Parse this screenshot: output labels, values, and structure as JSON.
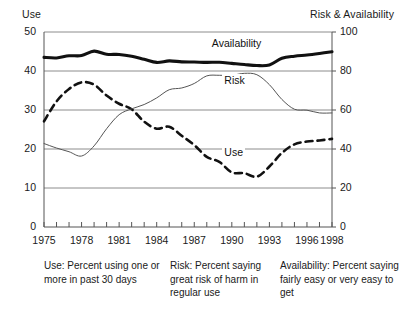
{
  "chart_data": {
    "type": "line",
    "title": "",
    "xlabel": "",
    "ylabel": "Use",
    "y2label": "Risk & Availability",
    "grid": true,
    "legend": "inline-labels",
    "xlim": [
      1975,
      1998
    ],
    "ylim": [
      0,
      50
    ],
    "y2lim": [
      0,
      100
    ],
    "xticks": [
      1975,
      1976,
      1977,
      1978,
      1979,
      1980,
      1981,
      1982,
      1983,
      1984,
      1985,
      1986,
      1987,
      1988,
      1989,
      1990,
      1991,
      1992,
      1993,
      1994,
      1995,
      1996,
      1997,
      1998
    ],
    "xtick_labels_shown": [
      "1975",
      "1978",
      "1981",
      "1984",
      "1987",
      "1990",
      "1993",
      "1996",
      "1998"
    ],
    "yticks": [
      0,
      10,
      20,
      30,
      40,
      50
    ],
    "y2ticks": [
      0,
      20,
      40,
      60,
      80,
      100
    ],
    "x": [
      1975,
      1976,
      1977,
      1978,
      1979,
      1980,
      1981,
      1982,
      1983,
      1984,
      1985,
      1986,
      1987,
      1988,
      1989,
      1990,
      1991,
      1992,
      1993,
      1994,
      1995,
      1996,
      1997,
      1998
    ],
    "series": [
      {
        "name": "Use",
        "axis": "left",
        "style": "dashed-thick",
        "color": "#111111",
        "values": [
          27.1,
          32.2,
          35.4,
          37.1,
          36.5,
          33.7,
          31.6,
          30.2,
          27.0,
          25.2,
          25.7,
          23.4,
          21.0,
          18.0,
          16.7,
          14.0,
          13.8,
          12.9,
          15.5,
          19.0,
          21.2,
          21.9,
          22.2,
          22.6
        ]
      },
      {
        "name": "Risk",
        "axis": "right",
        "style": "thin-solid",
        "color": "#555555",
        "values": [
          42.8,
          40.5,
          38.6,
          36.4,
          41.6,
          50.4,
          57.6,
          60.6,
          62.8,
          66.2,
          70.4,
          71.3,
          73.6,
          77.5,
          77.8,
          77.8,
          78.8,
          78.1,
          73.0,
          65.4,
          60.4,
          59.9,
          58.5,
          58.5
        ]
      },
      {
        "name": "Availability",
        "axis": "right",
        "style": "thick-solid",
        "color": "#111111",
        "values": [
          87.0,
          86.7,
          87.8,
          87.9,
          90.2,
          88.6,
          88.5,
          87.6,
          86.0,
          84.4,
          85.2,
          84.7,
          84.6,
          84.4,
          84.5,
          83.9,
          83.3,
          82.8,
          83.1,
          86.5,
          87.6,
          88.2,
          89.0,
          89.9
        ]
      }
    ],
    "annotations": [
      {
        "text": "Availability",
        "x": 1990,
        "axis": "right",
        "y": 94
      },
      {
        "text": "Risk",
        "x": 1991,
        "axis": "right",
        "y": 75
      },
      {
        "text": "Use",
        "x": 1991,
        "axis": "left",
        "y": 19
      }
    ]
  },
  "axis_titles": {
    "left": "Use",
    "right": "Risk & Availability"
  },
  "captions": {
    "use": "Use: Percent using one or more in past 30 days",
    "risk": "Risk: Percent saying great risk of harm in regular use",
    "availability": "Availability: Percent saying fairly easy or very easy to get"
  },
  "colors": {
    "ink": "#1a1a1a",
    "grid": "#8c8c8c",
    "frame": "#555555",
    "use_line": "#111111",
    "risk_line": "#555555",
    "availability_line": "#111111",
    "background": "#ffffff"
  }
}
